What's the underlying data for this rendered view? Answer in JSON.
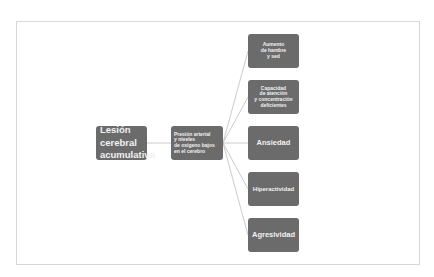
{
  "diagram": {
    "root": {
      "label": "Lesión\ncerebral\nacumulativa"
    },
    "middle": {
      "label": "Presión arterial\ny niveles\nde oxígeno bajos\nen el cerebro"
    },
    "outcomes": [
      {
        "label": "Aumento\nde hambre\ny sed"
      },
      {
        "label": "Capacidad\nde atención\ny concentración\ndeficientes"
      },
      {
        "label": "Ansiedad"
      },
      {
        "label": "Hiperactividad"
      },
      {
        "label": "Agresividad"
      }
    ],
    "colors": {
      "node_fill": "#6b6b6b",
      "node_text": "#f2f2f2",
      "connector": "#bdbdbd",
      "frame_border": "#d8d8d8"
    }
  }
}
